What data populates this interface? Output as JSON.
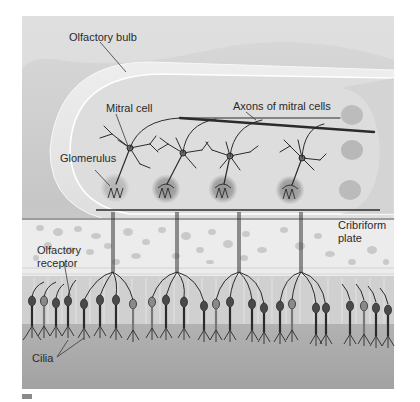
{
  "diagram": {
    "style": "grayscale illustration",
    "labels": {
      "olfactory_bulb": "Olfactory bulb",
      "mitral_cell": "Mitral cell",
      "axons_of_mitral_cells": "Axons of mitral cells",
      "glomerulus": "Glomerulus",
      "cribriform_plate_line1": "Cribriform",
      "cribriform_plate_line2": "plate",
      "olfactory_receptor_line1": "Olfactory",
      "olfactory_receptor_line2": "receptor",
      "cilia": "Cilia"
    },
    "structures": {
      "mitral_cell_count": 4,
      "glomerulus_count": 4,
      "receptor_cell_count": 24
    },
    "colors": {
      "background_tissue": "#d4d4d4",
      "bulb_fill": "#e6e6e6",
      "bulb_inner": "#dcdcdc",
      "bone": "#ececec",
      "bone_pores": "#c2c2c2",
      "epithelium": "#cfcfcf",
      "mucus_layer": "#a9a9a9",
      "neuron_ink": "#2b2b2b",
      "glomerulus_shade": "#9d9d9d"
    }
  }
}
